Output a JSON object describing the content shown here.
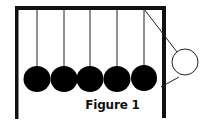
{
  "figure": {
    "caption": "Figure 1",
    "colors": {
      "frame": "#111111",
      "ball_fill": "#000000",
      "swing_ball_fill": "#ffffff",
      "background": "#ffffff"
    },
    "frame": {
      "left_post_x": 16,
      "right_post_x": 164,
      "top_y": 8,
      "bottom_y": 118
    },
    "resting_balls": [
      {
        "cx": 37,
        "cy": 79
      },
      {
        "cx": 64,
        "cy": 79
      },
      {
        "cx": 90,
        "cy": 79
      },
      {
        "cx": 117,
        "cy": 79
      },
      {
        "cx": 144,
        "cy": 78
      }
    ],
    "swinging_ball": {
      "cx": 185,
      "cy": 62,
      "r": 13,
      "fill": "white"
    }
  }
}
